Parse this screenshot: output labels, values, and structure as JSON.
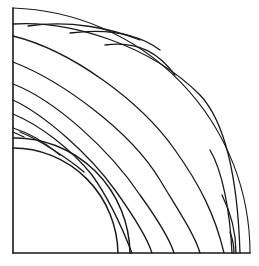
{
  "figure": {
    "colors": {
      "background": "#ffffff",
      "ink": "#1a1a1a"
    },
    "origin": [
      13,
      253
    ],
    "outer_radius": 245,
    "inner_arcs": [
      {
        "name": "inner-arc-outer",
        "radius": 115
      },
      {
        "name": "inner-arc-inner",
        "radius": 105
      }
    ]
  }
}
